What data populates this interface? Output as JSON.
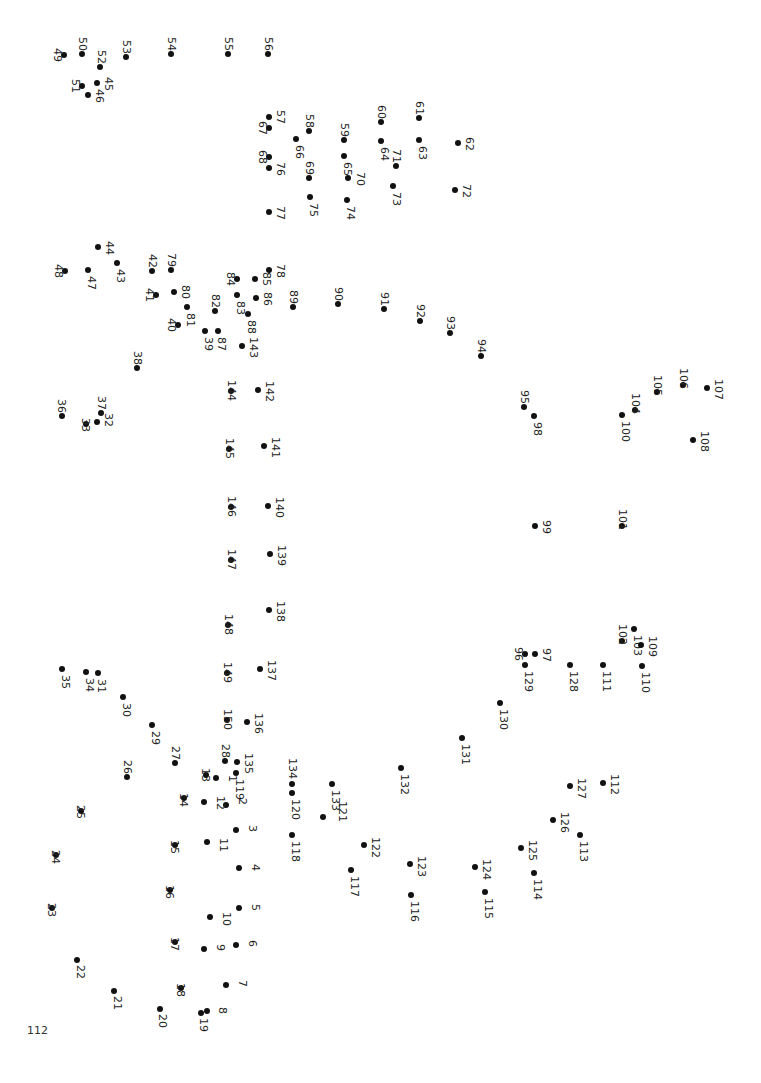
{
  "page_number": "112",
  "dot_color": "#111111",
  "dots": [
    {
      "n": "1",
      "x": 216,
      "y": 778,
      "lx": 227,
      "ly": 775
    },
    {
      "n": "2",
      "x": 226,
      "y": 805,
      "lx": 237,
      "ly": 798
    },
    {
      "n": "3",
      "x": 236,
      "y": 830,
      "lx": 247,
      "ly": 825
    },
    {
      "n": "4",
      "x": 239,
      "y": 868,
      "lx": 250,
      "ly": 864
    },
    {
      "n": "5",
      "x": 239,
      "y": 908,
      "lx": 250,
      "ly": 904
    },
    {
      "n": "6",
      "x": 236,
      "y": 945,
      "lx": 247,
      "ly": 940
    },
    {
      "n": "7",
      "x": 226,
      "y": 985,
      "lx": 237,
      "ly": 980
    },
    {
      "n": "8",
      "x": 207,
      "y": 1011,
      "lx": 217,
      "ly": 1007
    },
    {
      "n": "9",
      "x": 204,
      "y": 949,
      "lx": 215,
      "ly": 944
    },
    {
      "n": "10",
      "x": 210,
      "y": 917,
      "lx": 221,
      "ly": 912
    },
    {
      "n": "11",
      "x": 207,
      "y": 842,
      "lx": 218,
      "ly": 838
    },
    {
      "n": "12",
      "x": 204,
      "y": 802,
      "lx": 215,
      "ly": 796
    },
    {
      "n": "13",
      "x": 206,
      "y": 775,
      "lx": 200,
      "ly": 768
    },
    {
      "n": "14",
      "x": 184,
      "y": 798,
      "lx": 178,
      "ly": 793
    },
    {
      "n": "15",
      "x": 175,
      "y": 845,
      "lx": 169,
      "ly": 840
    },
    {
      "n": "16",
      "x": 170,
      "y": 890,
      "lx": 164,
      "ly": 885
    },
    {
      "n": "17",
      "x": 175,
      "y": 942,
      "lx": 169,
      "ly": 937
    },
    {
      "n": "18",
      "x": 181,
      "y": 988,
      "lx": 175,
      "ly": 983
    },
    {
      "n": "19",
      "x": 201,
      "y": 1013,
      "lx": 198,
      "ly": 1018
    },
    {
      "n": "20",
      "x": 160,
      "y": 1009,
      "lx": 157,
      "ly": 1014
    },
    {
      "n": "21",
      "x": 114,
      "y": 991,
      "lx": 112,
      "ly": 996
    },
    {
      "n": "22",
      "x": 77,
      "y": 960,
      "lx": 75,
      "ly": 965
    },
    {
      "n": "23",
      "x": 52,
      "y": 908,
      "lx": 46,
      "ly": 903
    },
    {
      "n": "24",
      "x": 56,
      "y": 855,
      "lx": 50,
      "ly": 850
    },
    {
      "n": "25",
      "x": 81,
      "y": 811,
      "lx": 75,
      "ly": 805
    },
    {
      "n": "26",
      "x": 127,
      "y": 777,
      "lx": 122,
      "ly": 760
    },
    {
      "n": "27",
      "x": 175,
      "y": 763,
      "lx": 170,
      "ly": 746
    },
    {
      "n": "28",
      "x": 225,
      "y": 761,
      "lx": 220,
      "ly": 744
    },
    {
      "n": "29",
      "x": 152,
      "y": 725,
      "lx": 150,
      "ly": 731
    },
    {
      "n": "30",
      "x": 123,
      "y": 697,
      "lx": 121,
      "ly": 703
    },
    {
      "n": "31",
      "x": 98,
      "y": 673,
      "lx": 96,
      "ly": 679
    },
    {
      "n": "32",
      "x": 97,
      "y": 422,
      "lx": 103,
      "ly": 413
    },
    {
      "n": "33",
      "x": 86,
      "y": 424,
      "lx": 80,
      "ly": 418
    },
    {
      "n": "34",
      "x": 86,
      "y": 672,
      "lx": 84,
      "ly": 678
    },
    {
      "n": "35",
      "x": 62,
      "y": 669,
      "lx": 60,
      "ly": 675
    },
    {
      "n": "36",
      "x": 62,
      "y": 416,
      "lx": 56,
      "ly": 399
    },
    {
      "n": "37",
      "x": 101,
      "y": 413,
      "lx": 96,
      "ly": 396
    },
    {
      "n": "38",
      "x": 137,
      "y": 368,
      "lx": 132,
      "ly": 351
    },
    {
      "n": "39",
      "x": 205,
      "y": 331,
      "lx": 203,
      "ly": 337
    },
    {
      "n": "40",
      "x": 178,
      "y": 325,
      "lx": 166,
      "ly": 318
    },
    {
      "n": "41",
      "x": 156,
      "y": 295,
      "lx": 144,
      "ly": 288
    },
    {
      "n": "42",
      "x": 152,
      "y": 271,
      "lx": 147,
      "ly": 254
    },
    {
      "n": "43",
      "x": 117,
      "y": 263,
      "lx": 115,
      "ly": 269
    },
    {
      "n": "44",
      "x": 98,
      "y": 247,
      "lx": 104,
      "ly": 241
    },
    {
      "n": "45",
      "x": 97,
      "y": 83,
      "lx": 103,
      "ly": 77
    },
    {
      "n": "46",
      "x": 88,
      "y": 95,
      "lx": 94,
      "ly": 89
    },
    {
      "n": "47",
      "x": 88,
      "y": 270,
      "lx": 86,
      "ly": 276
    },
    {
      "n": "48",
      "x": 65,
      "y": 271,
      "lx": 53,
      "ly": 264
    },
    {
      "n": "49",
      "x": 64,
      "y": 55,
      "lx": 52,
      "ly": 48
    },
    {
      "n": "50",
      "x": 82,
      "y": 54,
      "lx": 77,
      "ly": 37
    },
    {
      "n": "51",
      "x": 82,
      "y": 86,
      "lx": 70,
      "ly": 79
    },
    {
      "n": "52",
      "x": 100,
      "y": 67,
      "lx": 96,
      "ly": 50
    },
    {
      "n": "53",
      "x": 126,
      "y": 57,
      "lx": 121,
      "ly": 40
    },
    {
      "n": "54",
      "x": 171,
      "y": 54,
      "lx": 166,
      "ly": 37
    },
    {
      "n": "55",
      "x": 228,
      "y": 54,
      "lx": 223,
      "ly": 37
    },
    {
      "n": "56",
      "x": 268,
      "y": 54,
      "lx": 263,
      "ly": 37
    },
    {
      "n": "57",
      "x": 269,
      "y": 117,
      "lx": 275,
      "ly": 110
    },
    {
      "n": "58",
      "x": 309,
      "y": 131,
      "lx": 304,
      "ly": 114
    },
    {
      "n": "59",
      "x": 344,
      "y": 140,
      "lx": 339,
      "ly": 123
    },
    {
      "n": "60",
      "x": 381,
      "y": 122,
      "lx": 376,
      "ly": 105
    },
    {
      "n": "61",
      "x": 419,
      "y": 118,
      "lx": 414,
      "ly": 101
    },
    {
      "n": "62",
      "x": 458,
      "y": 143,
      "lx": 464,
      "ly": 137
    },
    {
      "n": "63",
      "x": 419,
      "y": 140,
      "lx": 417,
      "ly": 146
    },
    {
      "n": "64",
      "x": 381,
      "y": 141,
      "lx": 379,
      "ly": 147
    },
    {
      "n": "65",
      "x": 344,
      "y": 156,
      "lx": 342,
      "ly": 162
    },
    {
      "n": "66",
      "x": 296,
      "y": 139,
      "lx": 294,
      "ly": 145
    },
    {
      "n": "67",
      "x": 269,
      "y": 128,
      "lx": 257,
      "ly": 121
    },
    {
      "n": "68",
      "x": 269,
      "y": 157,
      "lx": 257,
      "ly": 150
    },
    {
      "n": "69",
      "x": 309,
      "y": 178,
      "lx": 304,
      "ly": 161
    },
    {
      "n": "70",
      "x": 348,
      "y": 178,
      "lx": 355,
      "ly": 172
    },
    {
      "n": "71",
      "x": 396,
      "y": 166,
      "lx": 391,
      "ly": 149
    },
    {
      "n": "72",
      "x": 455,
      "y": 190,
      "lx": 461,
      "ly": 184
    },
    {
      "n": "73",
      "x": 393,
      "y": 186,
      "lx": 391,
      "ly": 192
    },
    {
      "n": "74",
      "x": 347,
      "y": 200,
      "lx": 345,
      "ly": 206
    },
    {
      "n": "75",
      "x": 310,
      "y": 197,
      "lx": 308,
      "ly": 203
    },
    {
      "n": "76",
      "x": 269,
      "y": 168,
      "lx": 275,
      "ly": 162
    },
    {
      "n": "77",
      "x": 269,
      "y": 212,
      "lx": 275,
      "ly": 206
    },
    {
      "n": "78",
      "x": 269,
      "y": 270,
      "lx": 275,
      "ly": 264
    },
    {
      "n": "79",
      "x": 171,
      "y": 270,
      "lx": 166,
      "ly": 253
    },
    {
      "n": "80",
      "x": 174,
      "y": 292,
      "lx": 180,
      "ly": 285
    },
    {
      "n": "81",
      "x": 187,
      "y": 307,
      "lx": 185,
      "ly": 313
    },
    {
      "n": "82",
      "x": 215,
      "y": 311,
      "lx": 210,
      "ly": 294
    },
    {
      "n": "83",
      "x": 237,
      "y": 295,
      "lx": 235,
      "ly": 301
    },
    {
      "n": "84",
      "x": 237,
      "y": 279,
      "lx": 225,
      "ly": 272
    },
    {
      "n": "85",
      "x": 255,
      "y": 279,
      "lx": 261,
      "ly": 272
    },
    {
      "n": "86",
      "x": 256,
      "y": 298,
      "lx": 262,
      "ly": 292
    },
    {
      "n": "87",
      "x": 218,
      "y": 331,
      "lx": 216,
      "ly": 337
    },
    {
      "n": "88",
      "x": 248,
      "y": 314,
      "lx": 246,
      "ly": 320
    },
    {
      "n": "89",
      "x": 293,
      "y": 307,
      "lx": 288,
      "ly": 290
    },
    {
      "n": "90",
      "x": 338,
      "y": 304,
      "lx": 333,
      "ly": 287
    },
    {
      "n": "91",
      "x": 384,
      "y": 309,
      "lx": 379,
      "ly": 292
    },
    {
      "n": "92",
      "x": 420,
      "y": 321,
      "lx": 415,
      "ly": 304
    },
    {
      "n": "93",
      "x": 450,
      "y": 333,
      "lx": 445,
      "ly": 316
    },
    {
      "n": "94",
      "x": 481,
      "y": 356,
      "lx": 476,
      "ly": 339
    },
    {
      "n": "95",
      "x": 524,
      "y": 407,
      "lx": 519,
      "ly": 390
    },
    {
      "n": "96",
      "x": 525,
      "y": 654,
      "lx": 513,
      "ly": 647
    },
    {
      "n": "97",
      "x": 535,
      "y": 654,
      "lx": 541,
      "ly": 648
    },
    {
      "n": "98",
      "x": 534,
      "y": 416,
      "lx": 532,
      "ly": 422
    },
    {
      "n": "99",
      "x": 535,
      "y": 526,
      "lx": 541,
      "ly": 520
    },
    {
      "n": "100",
      "x": 622,
      "y": 415,
      "lx": 620,
      "ly": 421
    },
    {
      "n": "101",
      "x": 622,
      "y": 526,
      "lx": 617,
      "ly": 509
    },
    {
      "n": "102",
      "x": 622,
      "y": 641,
      "lx": 617,
      "ly": 624
    },
    {
      "n": "103",
      "x": 634,
      "y": 629,
      "lx": 632,
      "ly": 635
    },
    {
      "n": "104",
      "x": 635,
      "y": 410,
      "lx": 630,
      "ly": 393
    },
    {
      "n": "105",
      "x": 657,
      "y": 392,
      "lx": 652,
      "ly": 375
    },
    {
      "n": "106",
      "x": 683,
      "y": 385,
      "lx": 678,
      "ly": 368
    },
    {
      "n": "107",
      "x": 707,
      "y": 388,
      "lx": 713,
      "ly": 379
    },
    {
      "n": "108",
      "x": 693,
      "y": 440,
      "lx": 699,
      "ly": 431
    },
    {
      "n": "109",
      "x": 641,
      "y": 645,
      "lx": 647,
      "ly": 636
    },
    {
      "n": "110",
      "x": 642,
      "y": 666,
      "lx": 640,
      "ly": 672
    },
    {
      "n": "111",
      "x": 603,
      "y": 665,
      "lx": 601,
      "ly": 671
    },
    {
      "n": "112",
      "x": 603,
      "y": 783,
      "lx": 609,
      "ly": 774
    },
    {
      "n": "113",
      "x": 580,
      "y": 835,
      "lx": 578,
      "ly": 841
    },
    {
      "n": "114",
      "x": 534,
      "y": 873,
      "lx": 532,
      "ly": 879
    },
    {
      "n": "115",
      "x": 485,
      "y": 892,
      "lx": 483,
      "ly": 898
    },
    {
      "n": "116",
      "x": 411,
      "y": 895,
      "lx": 409,
      "ly": 901
    },
    {
      "n": "117",
      "x": 351,
      "y": 870,
      "lx": 349,
      "ly": 876
    },
    {
      "n": "118",
      "x": 292,
      "y": 835,
      "lx": 290,
      "ly": 841
    },
    {
      "n": "119",
      "x": 236,
      "y": 773,
      "lx": 234,
      "ly": 779
    },
    {
      "n": "120",
      "x": 292,
      "y": 793,
      "lx": 290,
      "ly": 799
    },
    {
      "n": "121",
      "x": 323,
      "y": 817,
      "lx": 337,
      "ly": 801
    },
    {
      "n": "122",
      "x": 364,
      "y": 845,
      "lx": 370,
      "ly": 837
    },
    {
      "n": "123",
      "x": 410,
      "y": 864,
      "lx": 416,
      "ly": 856
    },
    {
      "n": "124",
      "x": 475,
      "y": 867,
      "lx": 481,
      "ly": 859
    },
    {
      "n": "125",
      "x": 521,
      "y": 848,
      "lx": 527,
      "ly": 840
    },
    {
      "n": "126",
      "x": 553,
      "y": 820,
      "lx": 559,
      "ly": 812
    },
    {
      "n": "127",
      "x": 570,
      "y": 786,
      "lx": 576,
      "ly": 778
    },
    {
      "n": "128",
      "x": 570,
      "y": 665,
      "lx": 568,
      "ly": 671
    },
    {
      "n": "129",
      "x": 525,
      "y": 665,
      "lx": 523,
      "ly": 671
    },
    {
      "n": "130",
      "x": 500,
      "y": 703,
      "lx": 498,
      "ly": 709
    },
    {
      "n": "131",
      "x": 462,
      "y": 738,
      "lx": 460,
      "ly": 744
    },
    {
      "n": "132",
      "x": 401,
      "y": 768,
      "lx": 399,
      "ly": 774
    },
    {
      "n": "133",
      "x": 332,
      "y": 784,
      "lx": 330,
      "ly": 790
    },
    {
      "n": "134",
      "x": 292,
      "y": 784,
      "lx": 287,
      "ly": 758
    },
    {
      "n": "135",
      "x": 237,
      "y": 762,
      "lx": 243,
      "ly": 753
    },
    {
      "n": "136",
      "x": 247,
      "y": 722,
      "lx": 253,
      "ly": 713
    },
    {
      "n": "137",
      "x": 260,
      "y": 669,
      "lx": 266,
      "ly": 660
    },
    {
      "n": "138",
      "x": 269,
      "y": 610,
      "lx": 275,
      "ly": 601
    },
    {
      "n": "139",
      "x": 270,
      "y": 554,
      "lx": 276,
      "ly": 545
    },
    {
      "n": "140",
      "x": 268,
      "y": 506,
      "lx": 274,
      "ly": 497
    },
    {
      "n": "141",
      "x": 264,
      "y": 446,
      "lx": 270,
      "ly": 437
    },
    {
      "n": "142",
      "x": 258,
      "y": 390,
      "lx": 264,
      "ly": 381
    },
    {
      "n": "143",
      "x": 242,
      "y": 346,
      "lx": 248,
      "ly": 337
    },
    {
      "n": "144",
      "x": 231,
      "y": 391,
      "lx": 226,
      "ly": 380
    },
    {
      "n": "145",
      "x": 229,
      "y": 449,
      "lx": 224,
      "ly": 438
    },
    {
      "n": "146",
      "x": 231,
      "y": 507,
      "lx": 226,
      "ly": 496
    },
    {
      "n": "147",
      "x": 231,
      "y": 560,
      "lx": 226,
      "ly": 549
    },
    {
      "n": "148",
      "x": 228,
      "y": 625,
      "lx": 223,
      "ly": 614
    },
    {
      "n": "149",
      "x": 227,
      "y": 673,
      "lx": 222,
      "ly": 662
    },
    {
      "n": "150",
      "x": 227,
      "y": 720,
      "lx": 222,
      "ly": 709
    }
  ]
}
